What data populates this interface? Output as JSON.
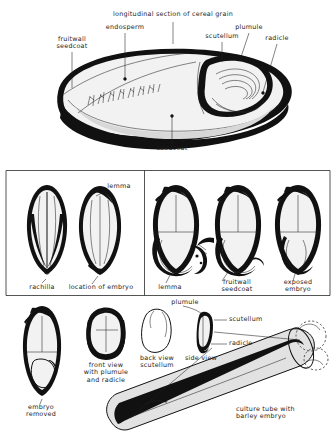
{
  "figure": {
    "title_caption": "longitudinal section of cereal grain"
  },
  "panel_top": {
    "name": "longitudinal-section-panel",
    "labels": {
      "heading": "longitudinal section of cereal grain",
      "endosperm": "endosperm",
      "plumule": "plumule",
      "scutellum": "scutellum",
      "radicle": "radicle",
      "fruitwall_seedcoat": "fruitwall\nseedcoat",
      "seedcoat": "seedcoat"
    }
  },
  "panel_mid_left": {
    "name": "whole-grain-views-panel",
    "labels": {
      "lemma": "lemma",
      "rachilla": "rachilla",
      "location_of_embryo": "location of embryo"
    }
  },
  "panel_mid_right": {
    "name": "dissection-sequence-panel",
    "labels": {
      "lemma": "lemma",
      "fruitwall_seedcoat": "fruitwall\nseedcoat",
      "exposed_embryo": "exposed\nembryo"
    }
  },
  "panel_bottom": {
    "name": "embryo-views-and-culture-panel",
    "labels": {
      "embryo_removed": "embryo\nremoved",
      "front_view": "front view\nwith plumule\nand radicle",
      "back_view": "back view\nscutellum",
      "side_view": "side view",
      "plumule": "plumule",
      "scutellum": "scutellum",
      "radicle": "radicle",
      "culture_tube": "culture tube with\nbarley embryo"
    }
  },
  "colors": {
    "ink": "#111111",
    "rule": "#2a2a2a",
    "paper": "#ffffff",
    "endosperm_fill": "#f2f2f2"
  }
}
